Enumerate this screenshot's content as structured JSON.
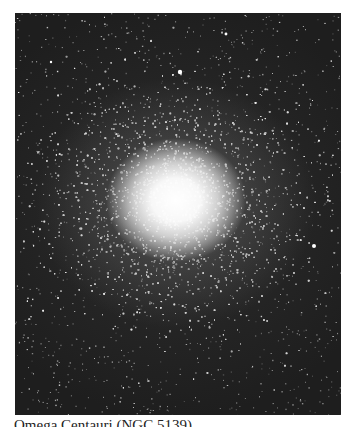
{
  "figure": {
    "caption": "Omega Centauri (NGC 5139)",
    "colors": {
      "sky": "#1e1e1e",
      "core": "#ffffff",
      "page": "#ffffff",
      "caption_text": "#222222"
    },
    "core_center": [
      161,
      187
    ],
    "bright_stars": [
      {
        "x": 165,
        "y": 59,
        "r": 2.2
      },
      {
        "x": 299,
        "y": 233,
        "r": 2.0
      },
      {
        "x": 211,
        "y": 21,
        "r": 1.4
      },
      {
        "x": 36,
        "y": 49,
        "r": 1.2
      },
      {
        "x": 144,
        "y": 405,
        "r": 1.3
      }
    ]
  }
}
